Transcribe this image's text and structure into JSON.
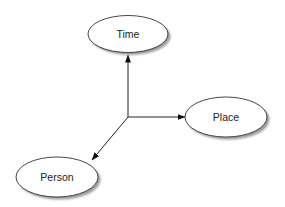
{
  "diagram": {
    "type": "hub-and-spoke",
    "hub": {
      "x": 128,
      "y": 117
    },
    "colors": {
      "stroke": "#333333",
      "fill": "#ffffff",
      "shadow": "#9a9a9a",
      "text": "#222222",
      "background": "#ffffff"
    },
    "nodes": [
      {
        "id": "time",
        "label": "Time",
        "cx": 128,
        "cy": 34,
        "rx": 40,
        "ry": 18.5
      },
      {
        "id": "place",
        "label": "Place",
        "cx": 226,
        "cy": 117,
        "rx": 41,
        "ry": 20
      },
      {
        "id": "person",
        "label": "Person",
        "cx": 57,
        "cy": 177,
        "rx": 41,
        "ry": 20
      }
    ],
    "edges": [
      {
        "from": "hub",
        "to": "time",
        "direction": "up"
      },
      {
        "from": "hub",
        "to": "place",
        "direction": "right"
      },
      {
        "from": "hub",
        "to": "person",
        "direction": "down-left"
      }
    ]
  }
}
